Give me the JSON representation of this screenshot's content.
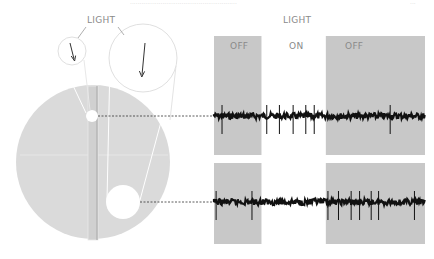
{
  "header_fragment": "........................................................",
  "page_number_fragment": "...",
  "diagram": {
    "light_label_left": "LIGHT",
    "light_label_right": "LIGHT",
    "colors": {
      "retina": "#dadada",
      "panel_off": "#c8c8c8",
      "trace": "#111111",
      "outline": "#e2e2e2",
      "text": "#8a8a8a"
    }
  },
  "recordings": {
    "condition_labels": [
      "OFF",
      "ON",
      "OFF"
    ],
    "time_range": [
      0,
      100
    ],
    "light_on_interval": [
      22.5,
      53.0
    ],
    "traces": [
      {
        "name": "center-spot-response",
        "description": "Spot of light on receptive field center",
        "spike_times": [
          3.8,
          25.0,
          31.0,
          37.5,
          43.5,
          47.5,
          83.5
        ]
      },
      {
        "name": "surround-annulus-response",
        "description": "Larger spot of light covering surround",
        "spike_times": [
          1.0,
          18.0,
          54.0,
          59.0,
          65.0,
          69.0,
          74.5,
          78.0,
          95.0
        ]
      }
    ]
  }
}
